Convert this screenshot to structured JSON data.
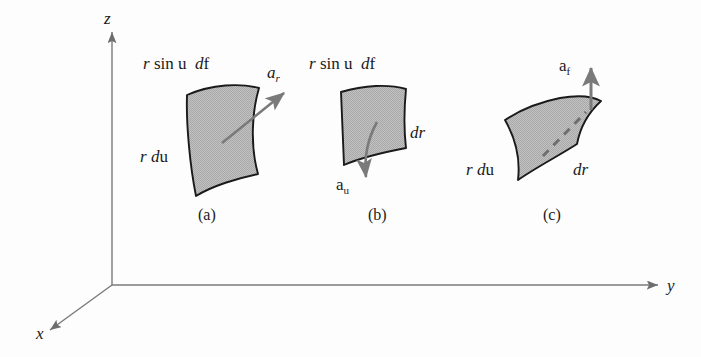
{
  "figure": {
    "background_color": "#fdfdfd",
    "patch_fill_color": "#b8b8b8",
    "stroke_color": "#1a1a1a",
    "arrow_color": "#6e6e6e"
  },
  "axes": {
    "x_label": "x",
    "y_label": "y",
    "z_label": "z"
  },
  "panels": [
    {
      "caption": "(a)",
      "top_label": {
        "r": "r",
        "sin": "sin",
        "theta": "u",
        "d": "d",
        "phi": "f"
      },
      "side_label": {
        "r": "r",
        "d": "d",
        "theta": "u"
      },
      "vector_label": {
        "base": "a",
        "sub": "r"
      }
    },
    {
      "caption": "(b)",
      "top_label": {
        "r": "r",
        "sin": "sin",
        "theta": "u",
        "d": "d",
        "phi": "f"
      },
      "side_label": {
        "d": "d",
        "r": "r"
      },
      "vector_label": {
        "base": "a",
        "sub": "u"
      }
    },
    {
      "caption": "(c)",
      "left_label": {
        "r": "r",
        "d": "d",
        "theta": "u"
      },
      "right_label": {
        "d": "d",
        "r": "r"
      },
      "vector_label": {
        "base": "a",
        "sub": "f"
      }
    }
  ]
}
